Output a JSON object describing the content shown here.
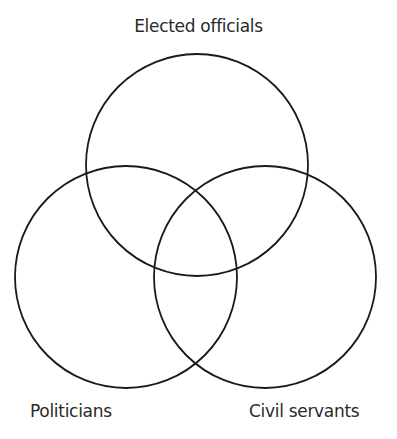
{
  "diagram": {
    "type": "venn",
    "sets": [
      {
        "label": "Elected officials",
        "cx": 197,
        "cy": 165,
        "r": 111
      },
      {
        "label": "Politicians",
        "cx": 126,
        "cy": 277,
        "r": 111
      },
      {
        "label": "Civil servants",
        "cx": 265,
        "cy": 277,
        "r": 111
      }
    ],
    "stroke_color": "#1a1a1a",
    "background": "#ffffff"
  }
}
